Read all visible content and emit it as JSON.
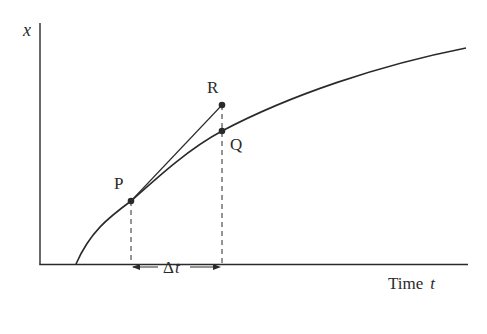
{
  "diagram": {
    "type": "secant-tangent-displacement-time",
    "axes": {
      "y_label": "x",
      "x_label_word": "Time",
      "x_label_var": "t"
    },
    "points": [
      {
        "id": "P",
        "label": "P",
        "role": "point on curve where tangent touches"
      },
      {
        "id": "Q",
        "label": "Q",
        "role": "point on curve after interval Δt"
      },
      {
        "id": "R",
        "label": "R",
        "role": "point on tangent line at time of Q"
      }
    ],
    "interval": {
      "label": "Δt",
      "label_prefix": "Δ",
      "label_var": "t"
    },
    "colors": {
      "ink": "#2a2a2a",
      "background": "#ffffff"
    }
  }
}
